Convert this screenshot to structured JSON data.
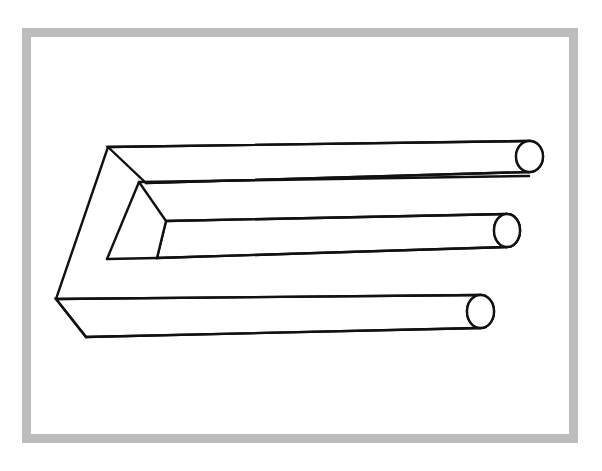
{
  "page": {
    "width": 602,
    "height": 471,
    "background_color": "#ffffff"
  },
  "frame": {
    "name": "picture-frame",
    "x": 22,
    "y": 28,
    "width": 556,
    "height": 415,
    "border_width": 9,
    "border_color": "#bdbdbd",
    "fill_color": "#ffffff"
  },
  "figure": {
    "name": "impossible-trident",
    "line_color": "#111111",
    "fill_color": "#ffffff",
    "stroke_width": 2.4,
    "prong_count": 3,
    "round_prongs": [
      {
        "name": "top-prong",
        "cap_center": [
          529.5,
          156.5
        ],
        "cap_rx": 13.5,
        "cap_ry": 15.5,
        "top_edge": [
          [
            108,
            147
          ],
          [
            529,
            141
          ]
        ],
        "bottom_edge": [
          [
            146,
            183
          ],
          [
            529,
            172
          ]
        ]
      },
      {
        "name": "middle-prong",
        "cap_center": [
          507,
          230.5
        ],
        "cap_rx": 13.0,
        "cap_ry": 16.5,
        "top_edge": [
          [
            166,
            221
          ],
          [
            507,
            214
          ]
        ],
        "bottom_edge": [
          [
            157,
            258
          ],
          [
            507,
            247
          ]
        ]
      },
      {
        "name": "bottom-prong",
        "cap_center": [
          480.5,
          311.5
        ],
        "cap_rx": 13.5,
        "cap_ry": 16.5,
        "top_edge": [
          [
            56,
            299
          ],
          [
            480,
            295
          ]
        ],
        "bottom_edge": [
          [
            86,
            337
          ],
          [
            480,
            328
          ]
        ]
      }
    ],
    "block_outline": [
      [
        108,
        147
      ],
      [
        56,
        299
      ],
      [
        86,
        337
      ],
      [
        157,
        258
      ],
      [
        139,
        182
      ],
      [
        166,
        221
      ]
    ],
    "inner_edges": [
      {
        "name": "block-upper-left-edge",
        "points": [
          [
            108,
            147
          ],
          [
            56,
            299
          ]
        ]
      },
      {
        "name": "block-lower-left-edge",
        "points": [
          [
            56,
            299
          ],
          [
            86,
            337
          ]
        ]
      },
      {
        "name": "block-notch-upper-edge",
        "points": [
          [
            139,
            182
          ],
          [
            166,
            221
          ]
        ]
      },
      {
        "name": "block-notch-lower-edge",
        "points": [
          [
            166,
            221
          ],
          [
            157,
            258
          ]
        ]
      },
      {
        "name": "block-inner-vertical",
        "points": [
          [
            139,
            182
          ],
          [
            146,
            183
          ]
        ]
      },
      {
        "name": "block-slot-top",
        "points": [
          [
            139,
            182
          ],
          [
            529,
            176
          ]
        ]
      },
      {
        "name": "block-slot-bottom",
        "points": [
          [
            107,
            259
          ],
          [
            157,
            258
          ]
        ]
      }
    ]
  },
  "labels": {
    "caption": ""
  }
}
